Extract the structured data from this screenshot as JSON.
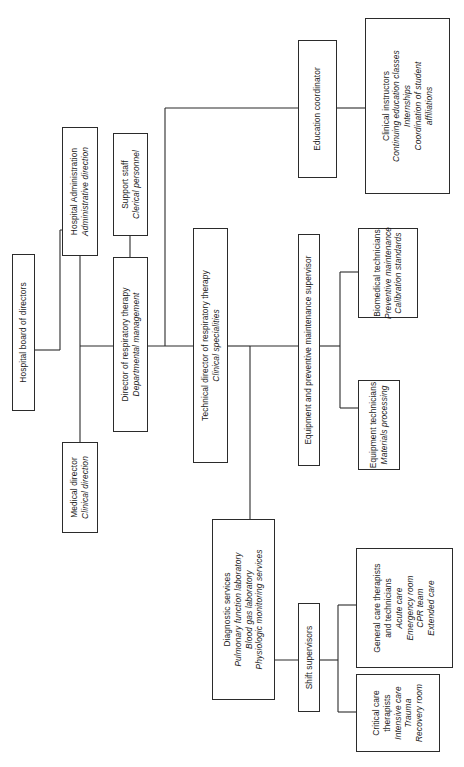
{
  "diagram": {
    "orientation": "rotated-90",
    "line_color": "#2b2b2b",
    "background": "#ffffff",
    "nodes": [
      {
        "id": "hospital-board",
        "name": "hospital-board-of-directors",
        "lines": [
          {
            "text": "Hospital board of directors",
            "italic": false
          }
        ]
      },
      {
        "id": "hospital-administration",
        "name": "hospital-administration",
        "lines": [
          {
            "text": "Hospital Administration",
            "italic": false
          },
          {
            "text": "Administrative direction",
            "italic": true
          }
        ]
      },
      {
        "id": "medical-director",
        "name": "medical-director",
        "lines": [
          {
            "text": "Medical director",
            "italic": false
          },
          {
            "text": "Clinical direction",
            "italic": true
          }
        ]
      },
      {
        "id": "support-staff",
        "name": "support-staff",
        "lines": [
          {
            "text": "Support staff",
            "italic": false
          },
          {
            "text": "Clerical personnel",
            "italic": true
          }
        ]
      },
      {
        "id": "director-respiratory-therapy",
        "name": "director-of-respiratory-therapy",
        "lines": [
          {
            "text": "Director of respiratory therapy",
            "italic": false
          },
          {
            "text": "Departmental management",
            "italic": true
          }
        ]
      },
      {
        "id": "technical-director",
        "name": "technical-director-of-respiratory-therapy",
        "lines": [
          {
            "text": "Technical director of respiratory therapy",
            "italic": false
          },
          {
            "text": "Clinical specialities",
            "italic": true
          }
        ]
      },
      {
        "id": "education-coordinator",
        "name": "education-coordinator",
        "lines": [
          {
            "text": "Education coordinator",
            "italic": false
          }
        ]
      },
      {
        "id": "clinical-instructors",
        "name": "clinical-instructors",
        "lines": [
          {
            "text": "Clinical instructors",
            "italic": false
          },
          {
            "text": "Continuing education classes",
            "italic": true
          },
          {
            "text": "Internships",
            "italic": true
          },
          {
            "text": "Coordination of student",
            "italic": true
          },
          {
            "text": "affiliations",
            "italic": true
          }
        ]
      },
      {
        "id": "equipment-supervisor",
        "name": "equipment-and-preventive-maintenance-supervisor",
        "lines": [
          {
            "text": "Equipment and preventive maintenance supervisor",
            "italic": false
          }
        ]
      },
      {
        "id": "biomedical-technicians",
        "name": "biomedical-technicians",
        "lines": [
          {
            "text": "Biomedical technicians",
            "italic": false
          },
          {
            "text": "Preventive maintenance",
            "italic": true
          },
          {
            "text": "Calibration standards",
            "italic": true
          }
        ]
      },
      {
        "id": "equipment-technicians",
        "name": "equipment-technicians",
        "lines": [
          {
            "text": "Equipment technicians",
            "italic": false
          },
          {
            "text": "Materials processing",
            "italic": true
          }
        ]
      },
      {
        "id": "diagnostic-services",
        "name": "diagnostic-services",
        "lines": [
          {
            "text": "Diagnostic services",
            "italic": false
          },
          {
            "text": "Pulmonary function laboratory",
            "italic": true
          },
          {
            "text": "Blood gas laboratory",
            "italic": true
          },
          {
            "text": "Physiologic monitoring services",
            "italic": true
          }
        ]
      },
      {
        "id": "shift-supervisors",
        "name": "shift-supervisors",
        "lines": [
          {
            "text": "Shift supervisors",
            "italic": false
          }
        ]
      },
      {
        "id": "general-care",
        "name": "general-care-therapists-and-technicians",
        "lines": [
          {
            "text": "General care therapists",
            "italic": false
          },
          {
            "text": "and technicians",
            "italic": false
          },
          {
            "text": "Acute care",
            "italic": true
          },
          {
            "text": "Emergency room",
            "italic": true
          },
          {
            "text": "CPR team",
            "italic": true
          },
          {
            "text": "Extended care",
            "italic": true
          }
        ]
      },
      {
        "id": "critical-care",
        "name": "critical-care-therapists",
        "lines": [
          {
            "text": "Critical care",
            "italic": false
          },
          {
            "text": "therapists",
            "italic": false
          },
          {
            "text": "Intensive care",
            "italic": true
          },
          {
            "text": "Trauma",
            "italic": true
          },
          {
            "text": "Recovery room",
            "italic": true
          }
        ]
      }
    ]
  }
}
